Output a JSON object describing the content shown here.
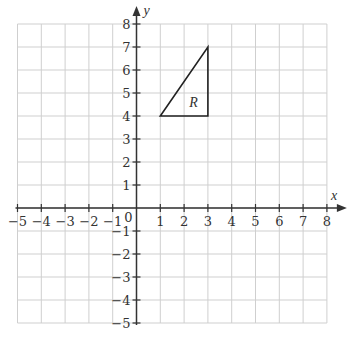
{
  "diagram": {
    "type": "coordinate-grid",
    "x_axis": {
      "label": "x",
      "min": -5,
      "max": 8,
      "ticks": [
        -5,
        -4,
        -3,
        -2,
        -1,
        0,
        1,
        2,
        3,
        4,
        5,
        6,
        7,
        8
      ]
    },
    "y_axis": {
      "label": "y",
      "min": -5,
      "max": 8,
      "ticks": [
        -5,
        -4,
        -3,
        -2,
        -1,
        1,
        2,
        3,
        4,
        5,
        6,
        7,
        8
      ]
    },
    "origin_label": "0",
    "shape": {
      "name": "R",
      "type": "triangle",
      "vertices": [
        [
          1,
          4
        ],
        [
          3,
          4
        ],
        [
          3,
          7
        ]
      ],
      "label_position": [
        2.4,
        4.6
      ]
    },
    "colors": {
      "grid": "#cfcfcf",
      "axis": "#333333",
      "shape": "#222222"
    }
  }
}
